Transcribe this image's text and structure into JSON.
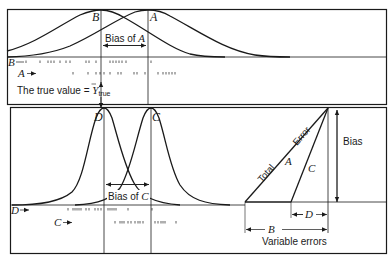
{
  "top_panel": {
    "curve_labels": {
      "b": "B",
      "a": "A"
    },
    "bias_label": "Bias of",
    "bias_var": "A",
    "row_labels": {
      "b": "B",
      "a": "A"
    },
    "true_value_text": "The true value = ",
    "true_value_symbol": "Y",
    "true_value_subscript": "true"
  },
  "bottom_panel": {
    "curve_labels": {
      "d": "D",
      "c": "C"
    },
    "bias_label": "Bias of",
    "bias_var": "C",
    "row_labels": {
      "d": "D",
      "c": "C"
    }
  },
  "error_triangle": {
    "hyp_label_1": "Total",
    "hyp_label_2": "Error",
    "line_a": "A",
    "line_c": "C",
    "bias": "Bias",
    "d_label": "D",
    "b_label": "B",
    "variable_errors": "Variable errors"
  },
  "colors": {
    "ink": "#1a1a1a",
    "background": "#ffffff"
  }
}
